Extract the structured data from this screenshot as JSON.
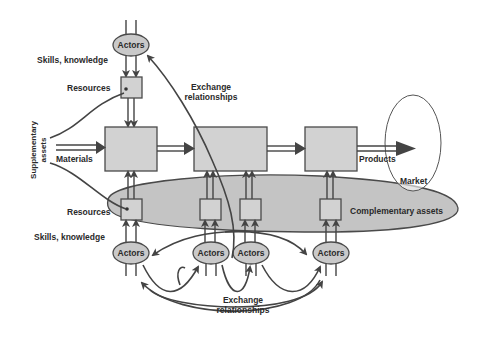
{
  "diagram": {
    "labels": {
      "actors": "Actors",
      "skills_knowledge": "Skills, knowledge",
      "resources": "Resources",
      "exchange_relationships_line1": "Exchange",
      "exchange_relationships_line2": "relationships",
      "supplementary_assets_line1": "Supplementary",
      "supplementary_assets_line2": "assets",
      "materials": "Materials",
      "products": "Products",
      "market": "Market",
      "complementary_assets": "Complementary assets"
    },
    "nodes": [
      {
        "id": "actors-top",
        "type": "actor",
        "label": "Actors"
      },
      {
        "id": "resources-top",
        "type": "resource",
        "label": "Resources"
      },
      {
        "id": "process-1",
        "type": "process"
      },
      {
        "id": "process-2",
        "type": "process"
      },
      {
        "id": "process-3",
        "type": "process"
      },
      {
        "id": "resources-bottom-1",
        "type": "resource",
        "label": "Resources"
      },
      {
        "id": "resources-bottom-2",
        "type": "resource"
      },
      {
        "id": "resources-bottom-3",
        "type": "resource"
      },
      {
        "id": "resources-bottom-4",
        "type": "resource"
      },
      {
        "id": "actors-bottom-1",
        "type": "actor",
        "label": "Actors"
      },
      {
        "id": "actors-bottom-2",
        "type": "actor",
        "label": "Actors"
      },
      {
        "id": "actors-bottom-3",
        "type": "actor",
        "label": "Actors"
      },
      {
        "id": "actors-bottom-4",
        "type": "actor",
        "label": "Actors"
      },
      {
        "id": "market",
        "type": "ellipse",
        "label": "Market"
      },
      {
        "id": "complementary-assets",
        "type": "ellipse",
        "label": "Complementary assets"
      }
    ],
    "colors": {
      "box_fill": "#d2d2d2",
      "actor_fill": "#c9c9c9",
      "complementary_fill": "#c4c4c4",
      "stroke": "#444444",
      "text": "#2a2a2a"
    }
  }
}
